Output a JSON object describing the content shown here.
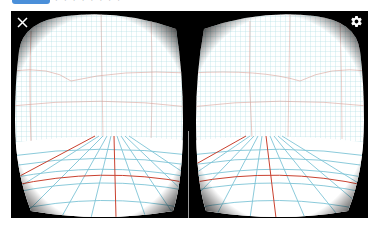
{
  "header": {
    "button_label": "",
    "faint_text": "· · · · · · · ·"
  },
  "vr_view": {
    "mode": "stereo",
    "eyes": [
      "left",
      "right"
    ],
    "close_icon": "close-icon",
    "settings_icon": "gear-icon",
    "colors": {
      "background": "#000000",
      "grid_base": "#ffffff",
      "grid_line_wall": "#9fd3da",
      "grid_line_accent": "#d9897e",
      "floor_line": "#7ec4d6",
      "floor_accent": "#c9412f",
      "divider": "#9a9a9a"
    }
  }
}
